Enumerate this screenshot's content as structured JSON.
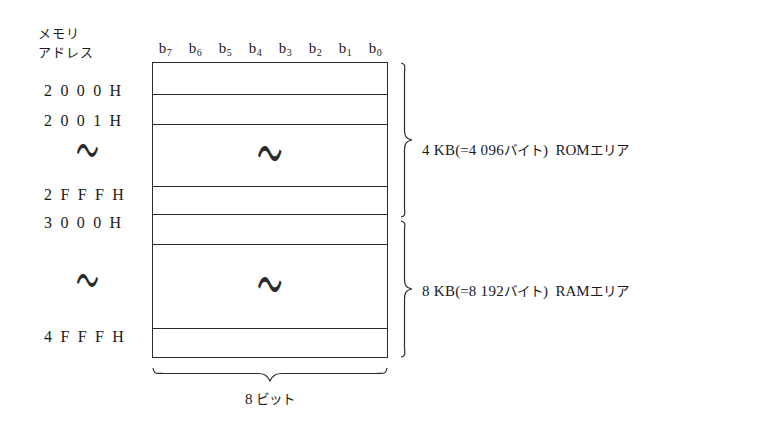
{
  "header": {
    "address_column_line1": "メモリ",
    "address_column_line2": "アドレス"
  },
  "bit_labels": [
    {
      "base": "b",
      "sub": "7"
    },
    {
      "base": "b",
      "sub": "6"
    },
    {
      "base": "b",
      "sub": "5"
    },
    {
      "base": "b",
      "sub": "4"
    },
    {
      "base": "b",
      "sub": "3"
    },
    {
      "base": "b",
      "sub": "2"
    },
    {
      "base": "b",
      "sub": "1"
    },
    {
      "base": "b",
      "sub": "0"
    }
  ],
  "addresses": {
    "rom_start": "2 0 0 0 H",
    "rom_second": "2 0 0 1 H",
    "rom_end": "2 F F F H",
    "ram_start": "3 0 0 0 H",
    "ram_end": "4 F F F H",
    "continuation": "〜"
  },
  "rows": [
    {
      "name": "rom-row-2000",
      "address": "2 0 0 0 H",
      "tilde": false
    },
    {
      "name": "rom-row-2001",
      "address": "2 0 0 1 H",
      "tilde": false
    },
    {
      "name": "rom-row-middle",
      "address": "",
      "tilde": true
    },
    {
      "name": "rom-row-2fff",
      "address": "2 F F F H",
      "tilde": false
    },
    {
      "name": "ram-row-3000",
      "address": "3 0 0 0 H",
      "tilde": false
    },
    {
      "name": "ram-row-middle",
      "address": "",
      "tilde": true
    },
    {
      "name": "ram-row-4fff",
      "address": "4 F F F H",
      "tilde": false
    }
  ],
  "regions": {
    "rom": {
      "size": "4 KB",
      "open_paren": "(=",
      "bytes": "4 096",
      "bytes_unit": "バイト",
      "close_paren": ")",
      "area": "ROM",
      "area_unit": "エリア",
      "full_label": "4 KB(=4 096バイト) ROMエリア"
    },
    "ram": {
      "size": "8 KB",
      "open_paren": "(=",
      "bytes": "8 192",
      "bytes_unit": "バイト",
      "close_paren": ")",
      "area": "RAM",
      "area_unit": "エリア",
      "full_label": "8 KB(=8 192バイト) RAMエリア"
    }
  },
  "width_annotation": {
    "value": "8",
    "unit": "ビット",
    "full_label": "8 ビット"
  },
  "colors": {
    "line": "#2b2b2b",
    "text": "#1a1a1a",
    "background": "#ffffff"
  }
}
